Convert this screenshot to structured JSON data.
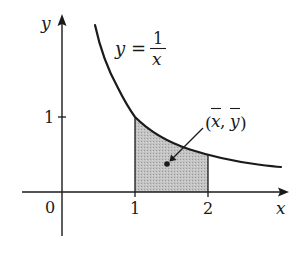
{
  "diagram": {
    "axes": {
      "x_label": "x",
      "y_label": "y",
      "origin_label": "0",
      "x_ticks": [
        "1",
        "2"
      ],
      "y_ticks": [
        "1"
      ]
    },
    "curve": {
      "equation_lhs": "y =",
      "equation_num": "1",
      "equation_den": "x",
      "x_range": [
        0.45,
        3.0
      ]
    },
    "region": {
      "x_from": 1,
      "x_to": 2,
      "fill_color": "#bdbdbd"
    },
    "centroid": {
      "label_open": "(",
      "label_x": "x",
      "label_sep": ", ",
      "label_y": "y",
      "label_close": ")"
    },
    "colors": {
      "ink": "#1a1a1a",
      "shade": "#bdbdbd",
      "background": "#ffffff"
    }
  }
}
